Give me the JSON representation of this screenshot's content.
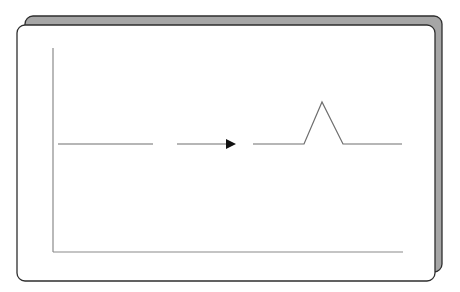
{
  "diagram": {
    "colors": {
      "background": "#ffffff",
      "back_panel_fill": "#a6a6a6",
      "panel_border": "#2e2e2e",
      "front_panel_fill": "#ffffff",
      "axis": "#8a8a8a",
      "signal_line": "#6e6e6e",
      "arrow": "#111111"
    },
    "back_panel": {
      "x": 25,
      "y": 16,
      "w": 417,
      "h": 256,
      "radius": 8
    },
    "front_panel": {
      "x": 17,
      "y": 25,
      "w": 418,
      "h": 256,
      "radius": 8
    },
    "axes": {
      "y_axis": {
        "x": 53,
        "y1": 48,
        "y2": 252
      },
      "x_axis": {
        "y": 252,
        "x1": 53,
        "x2": 403
      }
    },
    "segments": [
      {
        "name": "baseline-left",
        "points": [
          [
            58,
            144
          ],
          [
            153,
            144
          ]
        ]
      },
      {
        "name": "arrow-shaft",
        "points": [
          [
            177,
            144
          ],
          [
            227,
            144
          ]
        ]
      },
      {
        "name": "peak-signal",
        "points": [
          [
            253,
            144
          ],
          [
            304,
            144
          ],
          [
            322,
            102
          ],
          [
            343,
            144
          ],
          [
            402,
            144
          ]
        ]
      }
    ],
    "arrow_head": {
      "base_x": 226,
      "tip_x": 236,
      "y": 144,
      "half_height": 5
    }
  }
}
